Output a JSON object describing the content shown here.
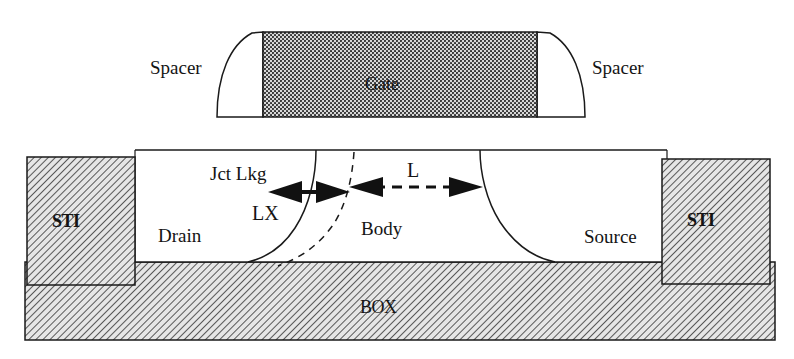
{
  "diagram": {
    "type": "SOI MOSFET cross-section",
    "labels": {
      "gate": "Gate",
      "spacer_left": "Spacer",
      "spacer_right": "Spacer",
      "sti_left": "STI",
      "sti_right": "STI",
      "box": "BOX",
      "drain": "Drain",
      "body": "Body",
      "source": "Source",
      "jct_lkg": "Jct Lkg",
      "lx": "LX",
      "l": "L"
    },
    "colors": {
      "line": "#1a1a1a",
      "hatch": "#3a3a3a",
      "gate_fill": "#8a8a8a",
      "background": "#ffffff"
    }
  }
}
